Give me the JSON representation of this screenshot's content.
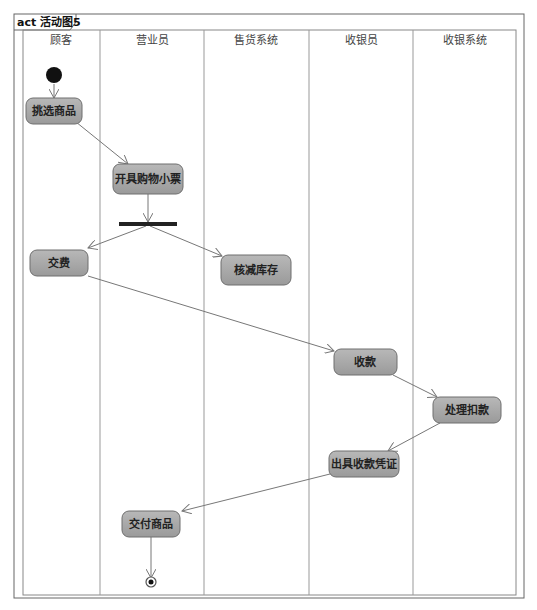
{
  "frame": {
    "title": "act 活动图5"
  },
  "lanes": [
    {
      "label": "顾客"
    },
    {
      "label": "营业员"
    },
    {
      "label": "售货系统"
    },
    {
      "label": "收银员"
    },
    {
      "label": "收银系统"
    }
  ],
  "nodes": {
    "n1": {
      "label": "挑选商品"
    },
    "n2": {
      "label": "开具购物小票"
    },
    "n3": {
      "label": "交费"
    },
    "n4": {
      "label": "核减库存"
    },
    "n5": {
      "label": "收款"
    },
    "n6": {
      "label": "处理扣款"
    },
    "n7": {
      "label": "出具收款凭证"
    },
    "n8": {
      "label": "交付商品"
    }
  },
  "colors": {
    "node_fill": "#a8a8a8",
    "node_stroke": "#6f6f6f",
    "line": "#777777",
    "bar": "#222222"
  }
}
